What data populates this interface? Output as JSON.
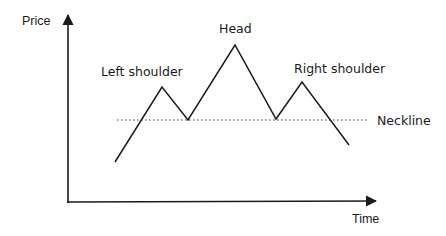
{
  "diagram": {
    "type": "head-and-shoulders pattern",
    "axes": {
      "y_label": "Price",
      "x_label": "Time"
    },
    "labels": {
      "left_shoulder": "Left shoulder",
      "head": "Head",
      "right_shoulder": "Right shoulder",
      "neckline": "Neckline"
    },
    "price_path": [
      {
        "point": "start",
        "x": 115,
        "y": 162
      },
      {
        "point": "left-shoulder-peak",
        "x": 162,
        "y": 87
      },
      {
        "point": "left-trough",
        "x": 188,
        "y": 120
      },
      {
        "point": "head-peak",
        "x": 235,
        "y": 45
      },
      {
        "point": "right-trough",
        "x": 276,
        "y": 119
      },
      {
        "point": "right-shoulder-peak",
        "x": 302,
        "y": 82
      },
      {
        "point": "end",
        "x": 349,
        "y": 145
      }
    ],
    "neckline": {
      "x1": 117,
      "y": 120,
      "x2": 368,
      "style": "dotted"
    },
    "colors": {
      "line": "#1a1a1a",
      "background": "#ffffff"
    }
  }
}
